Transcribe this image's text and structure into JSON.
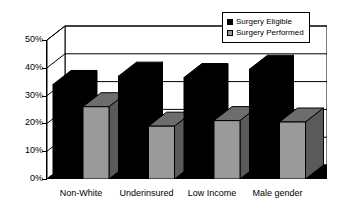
{
  "chart_data": {
    "type": "bar",
    "title": "",
    "xlabel": "",
    "ylabel": "",
    "ylim": [
      0,
      50
    ],
    "ytick_labels": [
      "0%",
      "10%",
      "20%",
      "30%",
      "40%",
      "50%"
    ],
    "ytick_values": [
      0,
      10,
      20,
      30,
      40,
      50
    ],
    "grid": true,
    "three_d": true,
    "legend_position": "top-right",
    "categories": [
      "Non-White",
      "Underinsured",
      "Low Income",
      "Male gender"
    ],
    "series": [
      {
        "name": "Surgery Eligible",
        "color": "#000000",
        "values": [
          34,
          37,
          36.5,
          39.5
        ]
      },
      {
        "name": "Surgery Performed",
        "color": "#9a9a9a",
        "values": [
          26,
          19,
          21,
          20.5
        ]
      }
    ]
  },
  "legend": {
    "items": [
      {
        "label": "Surgery Eligible",
        "color": "#000000"
      },
      {
        "label": "Surgery Performed",
        "color": "#9a9a9a"
      }
    ]
  },
  "colors": {
    "series_eligible": "#000000",
    "series_performed": "#9a9a9a",
    "series_performed_top": "#6d6d6d",
    "series_performed_side": "#5a5a5a",
    "floor": "#000000",
    "axis": "#000000",
    "grid": "#000000",
    "background": "#ffffff"
  }
}
